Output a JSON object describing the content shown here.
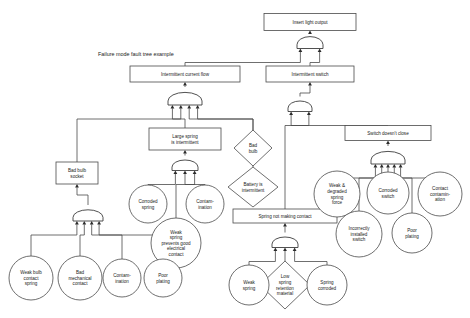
{
  "diagram": {
    "title": "Failure mode fault tree example",
    "title_pos": {
      "x": 98,
      "y": 56
    }
  },
  "nodes": [
    {
      "id": "top",
      "shape": "rect",
      "label_lines": [
        "Insert light output"
      ],
      "cx": 310,
      "cy": 22,
      "w": 92,
      "h": 17
    },
    {
      "id": "icf",
      "shape": "rect",
      "label_lines": [
        "Intermittent current flow"
      ],
      "cx": 185,
      "cy": 74,
      "w": 110,
      "h": 16
    },
    {
      "id": "isw",
      "shape": "rect",
      "label_lines": [
        "Intermittent switch"
      ],
      "cx": 310,
      "cy": 74,
      "w": 88,
      "h": 16
    },
    {
      "id": "lsi",
      "shape": "rect",
      "label_lines": [
        "Large spring",
        "is intermittent"
      ],
      "cx": 185,
      "cy": 139,
      "w": 72,
      "h": 22
    },
    {
      "id": "sdc",
      "shape": "rect",
      "label_lines": [
        "Switch doesn't close"
      ],
      "cx": 388,
      "cy": 133,
      "w": 86,
      "h": 15
    },
    {
      "id": "bbs",
      "shape": "rect",
      "label_lines": [
        "Bad bulb",
        "socket"
      ],
      "cx": 77,
      "cy": 173,
      "w": 42,
      "h": 22
    },
    {
      "id": "snmc",
      "shape": "rect",
      "label_lines": [
        "Spring not making contact"
      ],
      "cx": 285,
      "cy": 216,
      "w": 104,
      "h": 14
    },
    {
      "id": "badbulb",
      "shape": "diamond",
      "label_lines": [
        "Bad",
        "bulb"
      ],
      "cx": 253,
      "cy": 148,
      "w": 38,
      "h": 36
    },
    {
      "id": "batt",
      "shape": "diamond",
      "label_lines": [
        "Battery is",
        "intermittent"
      ],
      "cx": 253,
      "cy": 187,
      "w": 50,
      "h": 40
    },
    {
      "id": "lowspring",
      "shape": "diamond",
      "label_lines": [
        "Low",
        "spring",
        "retention",
        "material"
      ],
      "cx": 285,
      "cy": 285,
      "w": 50,
      "h": 48
    },
    {
      "id": "corrspring",
      "shape": "circle",
      "label_lines": [
        "Corroded",
        "spring"
      ],
      "cx": 148,
      "cy": 204,
      "r": 19
    },
    {
      "id": "contam1",
      "shape": "circle",
      "label_lines": [
        "Contam-",
        "ination"
      ],
      "cx": 205,
      "cy": 204,
      "r": 19
    },
    {
      "id": "weakspring",
      "shape": "circle",
      "label_lines": [
        "Weak",
        "spring",
        "prevents good",
        "electrical",
        "contact"
      ],
      "cx": 176,
      "cy": 243,
      "r": 25
    },
    {
      "id": "wbcs",
      "shape": "circle",
      "label_lines": [
        "Weak bulb",
        "contact",
        "spring"
      ],
      "cx": 31,
      "cy": 278,
      "r": 22
    },
    {
      "id": "bmc",
      "shape": "circle",
      "label_lines": [
        "Bad",
        "mechanical",
        "contact"
      ],
      "cx": 80,
      "cy": 278,
      "r": 22
    },
    {
      "id": "contam2",
      "shape": "circle",
      "label_lines": [
        "Contam-",
        "ination"
      ],
      "cx": 122,
      "cy": 278,
      "r": 19
    },
    {
      "id": "poorplat1",
      "shape": "circle",
      "label_lines": [
        "Poor",
        "plating"
      ],
      "cx": 163,
      "cy": 278,
      "r": 19
    },
    {
      "id": "weakspr2",
      "shape": "circle",
      "label_lines": [
        "Weak",
        "spring"
      ],
      "cx": 249,
      "cy": 285,
      "r": 20
    },
    {
      "id": "sprcorr",
      "shape": "circle",
      "label_lines": [
        "Spring",
        "corroded"
      ],
      "cx": 327,
      "cy": 285,
      "r": 20
    },
    {
      "id": "wdsf",
      "shape": "circle",
      "label_lines": [
        "Weak &",
        "degraded",
        "spring",
        "force"
      ],
      "cx": 337,
      "cy": 194,
      "r": 23
    },
    {
      "id": "corrsw",
      "shape": "circle",
      "label_lines": [
        "Corroded",
        "switch"
      ],
      "cx": 388,
      "cy": 193,
      "r": 21
    },
    {
      "id": "contactcont",
      "shape": "circle",
      "label_lines": [
        "Contact",
        "contamin-",
        "ation"
      ],
      "cx": 440,
      "cy": 194,
      "r": 22
    },
    {
      "id": "incorrsw",
      "shape": "circle",
      "label_lines": [
        "Incorrectly",
        "installed",
        "switch"
      ],
      "cx": 359,
      "cy": 234,
      "r": 23
    },
    {
      "id": "poorplat2",
      "shape": "circle",
      "label_lines": [
        "Poor",
        "plating"
      ],
      "cx": 412,
      "cy": 233,
      "r": 20
    }
  ],
  "gates": [
    {
      "id": "g-top",
      "type": "and",
      "cx": 310,
      "cy": 40,
      "w": 26,
      "h": 17,
      "inputs": 2
    },
    {
      "id": "g-icf",
      "type": "and",
      "cx": 185,
      "cy": 96,
      "w": 34,
      "h": 18,
      "inputs": 4
    },
    {
      "id": "g-isw",
      "type": "and",
      "cx": 300,
      "cy": 104,
      "w": 24,
      "h": 15,
      "inputs": 2
    },
    {
      "id": "g-sdc",
      "type": "and",
      "cx": 388,
      "cy": 155,
      "w": 34,
      "h": 18,
      "inputs": 5
    },
    {
      "id": "g-lsi",
      "type": "and",
      "cx": 185,
      "cy": 163,
      "w": 26,
      "h": 15,
      "inputs": 3
    },
    {
      "id": "g-bbs",
      "type": "and",
      "cx": 88,
      "cy": 213,
      "w": 30,
      "h": 16,
      "inputs": 4
    },
    {
      "id": "g-snmc",
      "type": "and",
      "cx": 285,
      "cy": 240,
      "w": 26,
      "h": 15,
      "inputs": 3
    }
  ],
  "edges": [
    {
      "from": "g-top",
      "to": "top"
    },
    {
      "from": "icf",
      "to": "g-top"
    },
    {
      "from": "isw",
      "to": "g-top"
    },
    {
      "from": "g-icf",
      "to": "icf"
    },
    {
      "from": "g-isw",
      "to": "isw"
    },
    {
      "from": "lsi",
      "to": "g-icf"
    },
    {
      "from": "bbs",
      "to": "g-icf"
    },
    {
      "from": "badbulb",
      "to": "g-icf"
    },
    {
      "from": "batt",
      "to": "g-icf"
    },
    {
      "from": "g-lsi",
      "to": "lsi"
    },
    {
      "from": "g-bbs",
      "to": "bbs"
    },
    {
      "from": "sdc",
      "to": "g-isw"
    },
    {
      "from": "snmc",
      "to": "g-isw"
    },
    {
      "from": "g-sdc",
      "to": "sdc"
    },
    {
      "from": "g-snmc",
      "to": "snmc"
    },
    {
      "from": "corrspring",
      "to": "g-lsi"
    },
    {
      "from": "contam1",
      "to": "g-lsi"
    },
    {
      "from": "weakspring",
      "to": "g-lsi"
    },
    {
      "from": "wbcs",
      "to": "g-bbs"
    },
    {
      "from": "bmc",
      "to": "g-bbs"
    },
    {
      "from": "contam2",
      "to": "g-bbs"
    },
    {
      "from": "poorplat1",
      "to": "g-bbs"
    },
    {
      "from": "weakspr2",
      "to": "g-snmc"
    },
    {
      "from": "lowspring",
      "to": "g-snmc"
    },
    {
      "from": "sprcorr",
      "to": "g-snmc"
    },
    {
      "from": "wdsf",
      "to": "g-sdc"
    },
    {
      "from": "corrsw",
      "to": "g-sdc"
    },
    {
      "from": "contactcont",
      "to": "g-sdc"
    },
    {
      "from": "incorrsw",
      "to": "g-sdc"
    },
    {
      "from": "poorplat2",
      "to": "g-sdc"
    }
  ]
}
